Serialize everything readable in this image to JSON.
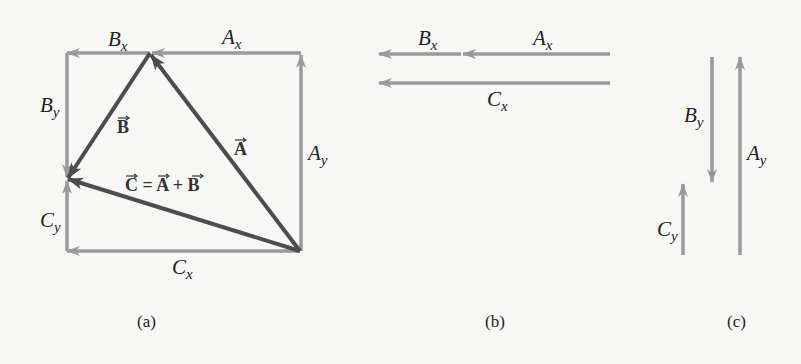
{
  "colors": {
    "background": "#f7f7f6",
    "component_arrow": "#9a9a9a",
    "resultant_arrow": "#4d4d4d",
    "text": "#222222"
  },
  "panel_a": {
    "caption": "(a)",
    "labels": {
      "Bx": {
        "base": "B",
        "sub": "x"
      },
      "Ax": {
        "base": "A",
        "sub": "x"
      },
      "By": {
        "base": "B",
        "sub": "y"
      },
      "Ay": {
        "base": "A",
        "sub": "y"
      },
      "Cy": {
        "base": "C",
        "sub": "y"
      },
      "Cx": {
        "base": "C",
        "sub": "x"
      }
    },
    "vectors": {
      "A": "A",
      "B": "B",
      "C_equation": {
        "c": "C",
        "eq": " = ",
        "a": "A",
        "plus": " + ",
        "b": "B"
      }
    }
  },
  "panel_b": {
    "caption": "(b)",
    "labels": {
      "Bx": {
        "base": "B",
        "sub": "x"
      },
      "Ax": {
        "base": "A",
        "sub": "x"
      },
      "Cx": {
        "base": "C",
        "sub": "x"
      }
    }
  },
  "panel_c": {
    "caption": "(c)",
    "labels": {
      "By": {
        "base": "B",
        "sub": "y"
      },
      "Ay": {
        "base": "A",
        "sub": "y"
      },
      "Cy": {
        "base": "C",
        "sub": "y"
      }
    }
  }
}
